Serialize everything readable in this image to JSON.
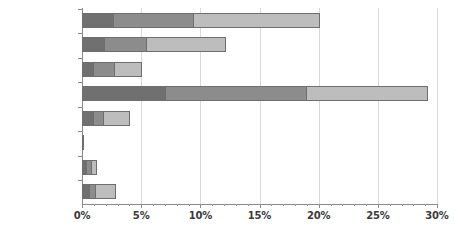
{
  "chart_data": {
    "type": "bar",
    "orientation": "horizontal",
    "stacked": true,
    "title": "",
    "subtitle": "",
    "xlabel": "",
    "ylabel": "",
    "xlim": [
      0,
      30
    ],
    "ylim": null,
    "grid": true,
    "legend": false,
    "legend_position": "none",
    "x_tick_format": "percent",
    "x_major_ticks": [
      0,
      5,
      10,
      15,
      20,
      25,
      30
    ],
    "x_tick_labels": [
      "0%",
      "5%",
      "10%",
      "15%",
      "20%",
      "25%",
      "30%"
    ],
    "x_minor_tick_step": 1,
    "categories": [
      "Mammals",
      "Birds",
      "Reptiles",
      "Amphibians",
      "Fishes",
      "Insects",
      "Molluscs",
      "Plants"
    ],
    "series": [
      {
        "name": "segment-1",
        "color": "#707070",
        "values": [
          2.6,
          1.9,
          0.9,
          7.0,
          0.9,
          0.1,
          0.35,
          0.6
        ]
      },
      {
        "name": "segment-2",
        "color": "#8c8c8c",
        "values": [
          6.8,
          3.5,
          1.8,
          11.9,
          0.9,
          0.0,
          0.4,
          0.5
        ]
      },
      {
        "name": "segment-3",
        "color": "#bdbdbd",
        "values": [
          10.7,
          6.8,
          2.4,
          10.3,
          2.3,
          0.0,
          0.55,
          1.8
        ]
      }
    ],
    "totals": [
      20.1,
      12.2,
      5.1,
      29.2,
      4.1,
      0.1,
      1.3,
      2.9
    ],
    "colors": {
      "segment_1": "#707070",
      "segment_2": "#8c8c8c",
      "segment_3": "#bdbdbd",
      "bar_border": "#6e6e6e",
      "axis": "#8a8a8a",
      "gridline": "#d9d9d9",
      "text": "#3a3a3a",
      "background": "#ffffff"
    }
  }
}
